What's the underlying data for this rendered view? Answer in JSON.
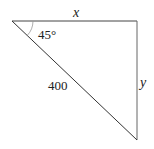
{
  "diagram": {
    "type": "right-triangle",
    "vertices": {
      "top_left": [
        12,
        21
      ],
      "top_right": [
        137,
        21
      ],
      "bottom_right": [
        137,
        140
      ]
    },
    "labels": {
      "top_side": "x",
      "right_side": "y",
      "hypotenuse": "400",
      "angle": "45°"
    },
    "colors": {
      "stroke": "#333333",
      "arc": "#999999",
      "text": "#222222"
    }
  }
}
